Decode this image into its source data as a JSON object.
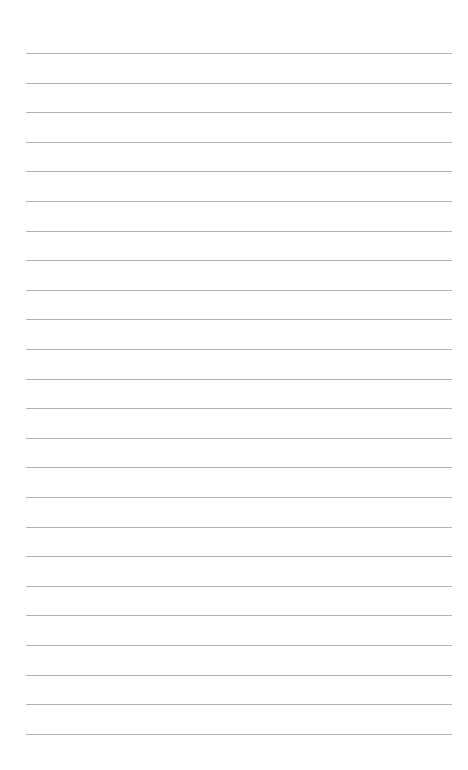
{
  "page": {
    "type": "lined-paper",
    "background_color": "#ffffff",
    "line_color": "#b4b4b4",
    "line_count": 24,
    "line_left": 26,
    "line_right": 452,
    "first_line_y": 53,
    "line_spacing": 29.6
  }
}
